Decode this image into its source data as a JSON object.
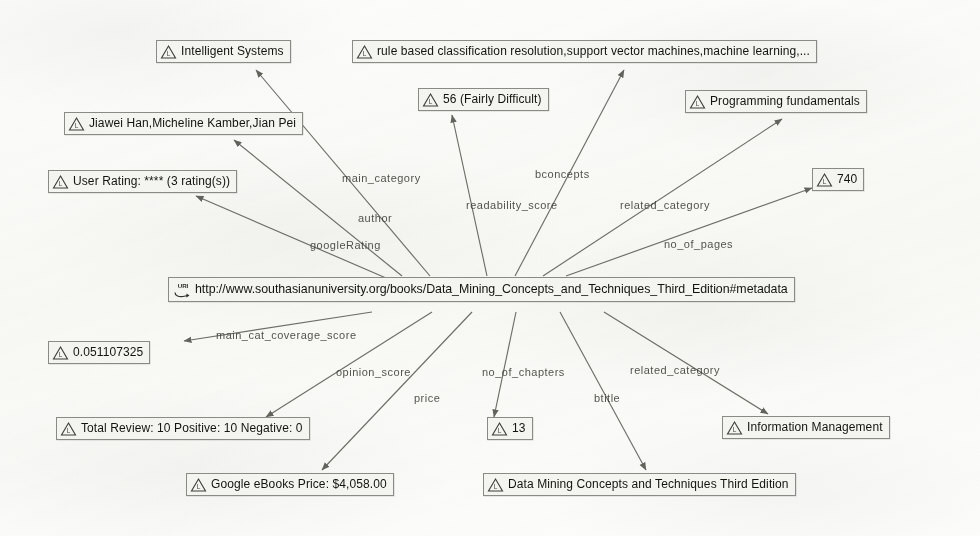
{
  "graph": {
    "title": "RDF metadata graph for Data Mining Concepts and Techniques Third Edition",
    "background_color": "#fcfcfa",
    "node_fill_color": "#f4f4f1",
    "node_border_color": "#8a8a86",
    "edge_color": "#5a5a55",
    "text_color": "#14140f",
    "subject": {
      "id": "uri-node",
      "type": "uri",
      "icon": "uri-icon",
      "label": "http://www.southasianuniversity.org/books/Data_Mining_Concepts_and_Techniques_Third_Edition#metadata"
    },
    "nodes": [
      {
        "id": "node-intelligent-systems",
        "icon": "literal-icon",
        "label": "Intelligent Systems"
      },
      {
        "id": "node-bconcepts",
        "icon": "literal-icon",
        "label": "rule based classification resolution,support vector machines,machine learning,..."
      },
      {
        "id": "node-readability",
        "icon": "literal-icon",
        "label": "56 (Fairly Difficult)"
      },
      {
        "id": "node-programming-fundamentals",
        "icon": "literal-icon",
        "label": "Programming fundamentals"
      },
      {
        "id": "node-authors",
        "icon": "literal-icon",
        "label": "Jiawei Han,Micheline Kamber,Jian Pei"
      },
      {
        "id": "node-user-rating",
        "icon": "literal-icon",
        "label": "User Rating: **** (3 rating(s))"
      },
      {
        "id": "node-no-of-pages",
        "icon": "literal-icon",
        "label": "740"
      },
      {
        "id": "node-coverage-score",
        "icon": "literal-icon",
        "label": "0.051107325"
      },
      {
        "id": "node-total-review",
        "icon": "literal-icon",
        "label": "Total Review: 10 Positive: 10 Negative: 0"
      },
      {
        "id": "node-no-of-chapters",
        "icon": "literal-icon",
        "label": "13"
      },
      {
        "id": "node-information-management",
        "icon": "literal-icon",
        "label": "Information Management"
      },
      {
        "id": "node-price",
        "icon": "literal-icon",
        "label": "Google eBooks Price: $4,058.00"
      },
      {
        "id": "node-btitle",
        "icon": "literal-icon",
        "label": "Data Mining Concepts and Techniques Third Edition"
      }
    ],
    "edges": [
      {
        "id": "edge-main-category",
        "label": "main_category",
        "target": "node-intelligent-systems"
      },
      {
        "id": "edge-bconcepts",
        "label": "bconcepts",
        "target": "node-bconcepts"
      },
      {
        "id": "edge-readability-score",
        "label": "readability_score",
        "target": "node-readability"
      },
      {
        "id": "edge-related-category-top",
        "label": "related_category",
        "target": "node-programming-fundamentals"
      },
      {
        "id": "edge-author",
        "label": "author",
        "target": "node-authors"
      },
      {
        "id": "edge-google-rating",
        "label": "googleRating",
        "target": "node-user-rating"
      },
      {
        "id": "edge-no-of-pages",
        "label": "no_of_pages",
        "target": "node-no-of-pages"
      },
      {
        "id": "edge-main-cat-coverage-score",
        "label": "main_cat_coverage_score",
        "target": "node-coverage-score"
      },
      {
        "id": "edge-opinion-score",
        "label": "opinion_score",
        "target": "node-total-review"
      },
      {
        "id": "edge-price",
        "label": "price",
        "target": "node-price"
      },
      {
        "id": "edge-no-of-chapters",
        "label": "no_of_chapters",
        "target": "node-no-of-chapters"
      },
      {
        "id": "edge-btitle",
        "label": "btitle",
        "target": "node-btitle"
      },
      {
        "id": "edge-related-category-bottom",
        "label": "related_category",
        "target": "node-information-management"
      }
    ]
  }
}
